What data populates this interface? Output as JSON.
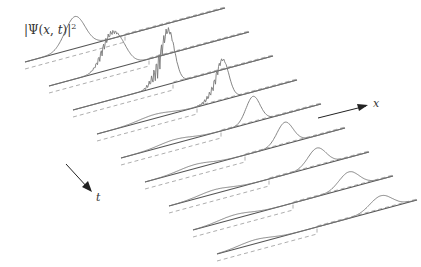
{
  "figure": {
    "ylabel": "|Ψ(x, t)|²",
    "ylabel_parts": {
      "pre": "|Ψ(",
      "x": "x",
      "mid": ", ",
      "t": "t",
      "post": ")|",
      "sup": "2"
    },
    "x_axis_label": "x",
    "t_axis_label": "t",
    "colors": {
      "curve": "#777777",
      "baseline": "#555555",
      "dashed": "#999999",
      "arrow": "#222222"
    }
  },
  "slices": [
    {
      "ox": 25,
      "oy": 62,
      "peak_pos": 0.25,
      "peak_h": 32,
      "width": 0.05,
      "osc": 0
    },
    {
      "ox": 49,
      "oy": 86,
      "peak_pos": 0.33,
      "peak_h": 34,
      "width": 0.05,
      "osc": 1
    },
    {
      "ox": 73,
      "oy": 110,
      "peak_pos": 0.48,
      "peak_h": 48,
      "width": 0.03,
      "osc": 2
    },
    {
      "ox": 97,
      "oy": 134,
      "peak_pos": 0.63,
      "peak_h": 38,
      "width": 0.03,
      "osc": 3
    },
    {
      "ox": 121,
      "oy": 158,
      "peak_pos": 0.66,
      "peak_h": 26,
      "width": 0.035,
      "osc": 4
    },
    {
      "ox": 145,
      "oy": 182,
      "peak_pos": 0.7,
      "peak_h": 22,
      "width": 0.04,
      "osc": 5
    },
    {
      "ox": 169,
      "oy": 206,
      "peak_pos": 0.74,
      "peak_h": 18,
      "width": 0.045,
      "osc": 6
    },
    {
      "ox": 193,
      "oy": 230,
      "peak_pos": 0.78,
      "peak_h": 16,
      "width": 0.05,
      "osc": 7
    },
    {
      "ox": 217,
      "oy": 254,
      "peak_pos": 0.82,
      "peak_h": 14,
      "width": 0.055,
      "osc": 8
    }
  ]
}
